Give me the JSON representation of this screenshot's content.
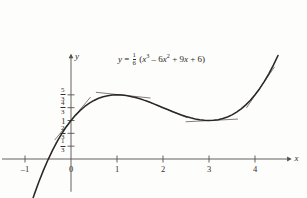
{
  "chart_data": {
    "type": "line",
    "title": "",
    "equation_text": "y = 1/6 (x^3 - 6x^2 + 9x + 6)",
    "equation_parts": {
      "lhs": "y",
      "equals": "=",
      "coef_num": "1",
      "coef_den": "6",
      "open_paren": "(",
      "term1_base": "x",
      "term1_exp": "3",
      "minus": "–",
      "term2_coef": "6",
      "term2_base": "x",
      "term2_exp": "2",
      "plus1": "+",
      "term3": "9",
      "term3_base": "x",
      "plus2": "+",
      "term4": "6",
      "close_paren": ")"
    },
    "xlabel": "x",
    "ylabel": "y",
    "xlim": [
      -1.5,
      4.6
    ],
    "ylim": [
      -0.85,
      2.55
    ],
    "xticks": [
      -1,
      0,
      1,
      2,
      3,
      4
    ],
    "xticklabels": [
      "–1",
      "0",
      "1",
      "2",
      "3",
      "4"
    ],
    "yticks": [
      0.3333,
      0.6667,
      1.0,
      1.3333,
      1.6667
    ],
    "yticklabels": [
      "1/3",
      "2/3",
      "1",
      "4/3",
      "5/3"
    ],
    "yticklabels_parts": [
      {
        "num": "1",
        "den": "3",
        "whole": ""
      },
      {
        "num": "2",
        "den": "3",
        "whole": ""
      },
      {
        "num": "",
        "den": "",
        "whole": "1"
      },
      {
        "num": "4",
        "den": "3",
        "whole": ""
      },
      {
        "num": "5",
        "den": "3",
        "whole": ""
      }
    ],
    "grid": false,
    "legend": "none",
    "curve_points_x": [
      -1.5,
      -1.4,
      -1.3,
      -1.2,
      -1.1,
      -1.0,
      -0.9,
      -0.8,
      -0.7,
      -0.6,
      -0.5,
      -0.4,
      -0.3,
      -0.2,
      -0.1,
      0.0,
      0.1,
      0.2,
      0.3,
      0.4,
      0.5,
      0.6,
      0.7,
      0.8,
      0.9,
      1.0,
      1.1,
      1.2,
      1.3,
      1.4,
      1.5,
      1.6,
      1.7,
      1.8,
      1.9,
      2.0,
      2.1,
      2.2,
      2.3,
      2.4,
      2.5,
      2.6,
      2.7,
      2.8,
      2.9,
      3.0,
      3.1,
      3.2,
      3.3,
      3.4,
      3.5,
      3.6,
      3.7,
      3.8,
      3.9,
      4.0,
      4.1,
      4.2,
      4.3,
      4.4,
      4.5
    ],
    "annotations": [
      {
        "name": "tangent-at-x0",
        "x0": -0.35,
        "x1": 0.42,
        "note": "tangent line at x = 0"
      },
      {
        "name": "tangent-at-local-max",
        "x0": 0.55,
        "x1": 1.72,
        "note": "horizontal tangent at local max x = 1"
      },
      {
        "name": "tangent-at-inflection",
        "x0": 1.62,
        "x1": 2.52,
        "note": "tangent at inflection x = 2"
      },
      {
        "name": "tangent-at-local-min",
        "x0": 2.5,
        "x1": 3.62,
        "note": "horizontal tangent at local min x = 3"
      },
      {
        "name": "tangent-right",
        "x0": 3.82,
        "x1": 4.42,
        "note": "tangent on rising branch"
      }
    ],
    "local_max": {
      "x": 1,
      "y": 1.6667
    },
    "local_min": {
      "x": 3,
      "y": 1.0
    },
    "inflection": {
      "x": 2,
      "y": 1.3333
    },
    "y_intercept": {
      "x": 0,
      "y": 1.0
    },
    "colors": {
      "curve": "#2b2724",
      "axis": "#55514e",
      "tangent": "#6b6663",
      "text": "#332f2c",
      "background": "#fdfdfc"
    }
  }
}
